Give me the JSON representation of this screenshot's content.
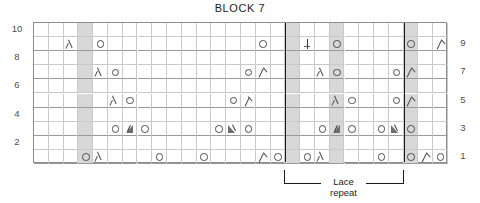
{
  "chart": {
    "title": "BLOCK 7",
    "type": "knitting-chart",
    "columns": 28,
    "rows": 10,
    "row_labels_left": [
      "10",
      "",
      "8",
      "",
      "6",
      "",
      "4",
      "",
      "2",
      ""
    ],
    "row_labels_right": [
      "",
      "9",
      "",
      "7",
      "",
      "5",
      "",
      "3",
      "",
      "1"
    ],
    "shaded_columns": [
      3,
      17,
      20,
      25
    ],
    "repeat_boundary_columns": [
      17,
      25
    ],
    "repeat_label_line1": "Lace",
    "repeat_label_line2": "repeat",
    "symbol_names": {
      "yo": "yarn-over-icon",
      "k2tog": "right-leaning-decrease-icon",
      "ssk": "left-leaning-decrease-icon",
      "cdd": "centered-double-decrease-icon",
      "m1l": "raised-increase-left-icon",
      "m1r": "raised-increase-right-icon"
    },
    "cells": [
      {
        "row": 10,
        "symbols": []
      },
      {
        "row": 9,
        "symbols": [
          {
            "col": 2,
            "sym": "k2tog"
          },
          {
            "col": 4,
            "sym": "yo"
          },
          {
            "col": 15,
            "sym": "yo"
          },
          {
            "col": 18,
            "sym": "cdd"
          },
          {
            "col": 20,
            "sym": "yo"
          },
          {
            "col": 25,
            "sym": "yo"
          },
          {
            "col": 27,
            "sym": "ssk"
          }
        ]
      },
      {
        "row": 8,
        "symbols": []
      },
      {
        "row": 7,
        "symbols": [
          {
            "col": 4,
            "sym": "k2tog"
          },
          {
            "col": 5,
            "sym": "yo"
          },
          {
            "col": 14,
            "sym": "yo"
          },
          {
            "col": 15,
            "sym": "ssk"
          },
          {
            "col": 19,
            "sym": "k2tog"
          },
          {
            "col": 20,
            "sym": "yo"
          },
          {
            "col": 24,
            "sym": "yo"
          },
          {
            "col": 25,
            "sym": "ssk"
          }
        ]
      },
      {
        "row": 6,
        "symbols": []
      },
      {
        "row": 5,
        "symbols": [
          {
            "col": 5,
            "sym": "k2tog"
          },
          {
            "col": 6,
            "sym": "yo"
          },
          {
            "col": 13,
            "sym": "yo"
          },
          {
            "col": 14,
            "sym": "ssk"
          },
          {
            "col": 20,
            "sym": "k2tog"
          },
          {
            "col": 21,
            "sym": "yo"
          },
          {
            "col": 24,
            "sym": "yo"
          },
          {
            "col": 25,
            "sym": "ssk"
          }
        ]
      },
      {
        "row": 4,
        "symbols": []
      },
      {
        "row": 3,
        "symbols": [
          {
            "col": 5,
            "sym": "yo"
          },
          {
            "col": 6,
            "sym": "m1l"
          },
          {
            "col": 7,
            "sym": "yo"
          },
          {
            "col": 12,
            "sym": "yo"
          },
          {
            "col": 13,
            "sym": "m1r"
          },
          {
            "col": 14,
            "sym": "yo"
          },
          {
            "col": 19,
            "sym": "yo"
          },
          {
            "col": 20,
            "sym": "m1l"
          },
          {
            "col": 21,
            "sym": "yo"
          },
          {
            "col": 23,
            "sym": "yo"
          },
          {
            "col": 24,
            "sym": "m1r"
          },
          {
            "col": 25,
            "sym": "yo"
          }
        ]
      },
      {
        "row": 2,
        "symbols": []
      },
      {
        "row": 1,
        "symbols": [
          {
            "col": 3,
            "sym": "yo"
          },
          {
            "col": 4,
            "sym": "k2tog"
          },
          {
            "col": 8,
            "sym": "yo"
          },
          {
            "col": 11,
            "sym": "yo"
          },
          {
            "col": 15,
            "sym": "ssk"
          },
          {
            "col": 16,
            "sym": "yo"
          },
          {
            "col": 18,
            "sym": "yo"
          },
          {
            "col": 19,
            "sym": "k2tog"
          },
          {
            "col": 23,
            "sym": "yo"
          },
          {
            "col": 25,
            "sym": "yo"
          },
          {
            "col": 26,
            "sym": "ssk"
          },
          {
            "col": 27,
            "sym": "yo"
          }
        ]
      }
    ]
  },
  "chart_data": {
    "type": "table",
    "title": "BLOCK 7",
    "xlabel": "",
    "ylabel": "",
    "categories": [
      "1",
      "2",
      "3",
      "4",
      "5",
      "6",
      "7",
      "8",
      "9",
      "10",
      "11",
      "12",
      "13",
      "14",
      "15",
      "16",
      "17",
      "18",
      "19",
      "20",
      "21",
      "22",
      "23",
      "24",
      "25",
      "26",
      "27",
      "28"
    ],
    "series": [
      {
        "name": "Row 10",
        "values": [
          "",
          "",
          "",
          "",
          "",
          "",
          "",
          "",
          "",
          "",
          "",
          "",
          "",
          "",
          "",
          "",
          "",
          "",
          "",
          "",
          "",
          "",
          "",
          "",
          "",
          "",
          "",
          ""
        ]
      },
      {
        "name": "Row 9",
        "values": [
          "",
          "",
          "k2tog",
          "",
          "yo",
          "",
          "",
          "",
          "",
          "",
          "",
          "",
          "",
          "",
          "",
          "yo",
          "",
          "",
          "cdd",
          "",
          "yo",
          "",
          "",
          "",
          "",
          "yo",
          "",
          "ssk"
        ]
      },
      {
        "name": "Row 8",
        "values": [
          "",
          "",
          "",
          "",
          "",
          "",
          "",
          "",
          "",
          "",
          "",
          "",
          "",
          "",
          "",
          "",
          "",
          "",
          "",
          "",
          "",
          "",
          "",
          "",
          "",
          "",
          "",
          ""
        ]
      },
      {
        "name": "Row 7",
        "values": [
          "",
          "",
          "",
          "",
          "k2tog",
          "yo",
          "",
          "",
          "",
          "",
          "",
          "",
          "",
          "",
          "yo",
          "ssk",
          "",
          "",
          "",
          "k2tog",
          "yo",
          "",
          "",
          "",
          "yo",
          "ssk",
          "",
          ""
        ]
      },
      {
        "name": "Row 6",
        "values": [
          "",
          "",
          "",
          "",
          "",
          "",
          "",
          "",
          "",
          "",
          "",
          "",
          "",
          "",
          "",
          "",
          "",
          "",
          "",
          "",
          "",
          "",
          "",
          "",
          "",
          "",
          "",
          ""
        ]
      },
      {
        "name": "Row 5",
        "values": [
          "",
          "",
          "",
          "",
          "",
          "k2tog",
          "yo",
          "",
          "",
          "",
          "",
          "",
          "",
          "yo",
          "ssk",
          "",
          "",
          "",
          "",
          "",
          "k2tog",
          "yo",
          "",
          "",
          "yo",
          "ssk",
          "",
          ""
        ]
      },
      {
        "name": "Row 4",
        "values": [
          "",
          "",
          "",
          "",
          "",
          "",
          "",
          "",
          "",
          "",
          "",
          "",
          "",
          "",
          "",
          "",
          "",
          "",
          "",
          "",
          "",
          "",
          "",
          "",
          "",
          "",
          "",
          ""
        ]
      },
      {
        "name": "Row 3",
        "values": [
          "",
          "",
          "",
          "",
          "",
          "yo",
          "m1l",
          "yo",
          "",
          "",
          "",
          "",
          "yo",
          "m1r",
          "yo",
          "",
          "",
          "",
          "",
          "yo",
          "m1l",
          "yo",
          "",
          "yo",
          "m1r",
          "yo",
          "",
          ""
        ]
      },
      {
        "name": "Row 2",
        "values": [
          "",
          "",
          "",
          "",
          "",
          "",
          "",
          "",
          "",
          "",
          "",
          "",
          "",
          "",
          "",
          "",
          "",
          "",
          "",
          "",
          "",
          "",
          "",
          "",
          "",
          "",
          "",
          ""
        ]
      },
      {
        "name": "Row 1",
        "values": [
          "",
          "",
          "",
          "yo",
          "k2tog",
          "",
          "",
          "",
          "yo",
          "",
          "",
          "yo",
          "",
          "",
          "",
          "ssk",
          "yo",
          "",
          "yo",
          "k2tog",
          "",
          "",
          "",
          "yo",
          "",
          "yo",
          "ssk",
          "yo"
        ]
      }
    ],
    "legend": [
      "yo = yarn over",
      "k2tog = right-leaning decrease",
      "ssk = left-leaning decrease",
      "cdd = centered double decrease",
      "m1 = raised increase"
    ]
  }
}
